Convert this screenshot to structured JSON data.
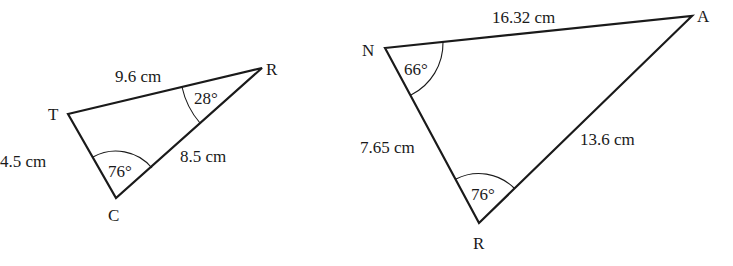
{
  "triangles": [
    {
      "id": "TRC",
      "vertices": [
        {
          "name": "T",
          "x": 68,
          "y": 114,
          "label_x": 48,
          "label_y": 120
        },
        {
          "name": "R",
          "x": 262,
          "y": 68,
          "label_x": 266,
          "label_y": 75
        },
        {
          "name": "C",
          "x": 116,
          "y": 198,
          "label_x": 108,
          "label_y": 221
        }
      ],
      "sides": [
        {
          "between": "T-R",
          "text": "9.6 cm",
          "x": 115,
          "y": 82
        },
        {
          "between": "T-C",
          "text": "4.5 cm",
          "x": 0,
          "y": 167
        },
        {
          "between": "R-C",
          "text": "8.5 cm",
          "x": 180,
          "y": 162
        }
      ],
      "angles": [
        {
          "vertex": "R",
          "text": "28°",
          "x": 194,
          "y": 104
        },
        {
          "vertex": "C",
          "text": "76°",
          "x": 108,
          "y": 177
        }
      ]
    },
    {
      "id": "NAR",
      "vertices": [
        {
          "name": "N",
          "x": 385,
          "y": 48,
          "label_x": 362,
          "label_y": 56
        },
        {
          "name": "A",
          "x": 692,
          "y": 16,
          "label_x": 697,
          "label_y": 22
        },
        {
          "name": "R",
          "x": 479,
          "y": 223,
          "label_x": 473,
          "label_y": 249
        }
      ],
      "sides": [
        {
          "between": "N-A",
          "text": "16.32 cm",
          "x": 492,
          "y": 23
        },
        {
          "between": "N-R",
          "text": "7.65 cm",
          "x": 360,
          "y": 153
        },
        {
          "between": "A-R",
          "text": "13.6 cm",
          "x": 580,
          "y": 145
        }
      ],
      "angles": [
        {
          "vertex": "N",
          "text": "66°",
          "x": 404,
          "y": 75
        },
        {
          "vertex": "R",
          "text": "76°",
          "x": 471,
          "y": 200
        }
      ]
    }
  ]
}
